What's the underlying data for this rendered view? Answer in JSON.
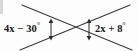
{
  "figure": {
    "type": "geometry-diagram",
    "background_color": "#fdfdfd",
    "stroke_color": "#3a3a3a",
    "text_color": "#151515",
    "labels": {
      "left": {
        "text": "4x − 30",
        "degree": "°",
        "full": "4x − 30°",
        "expression": "4x - 30",
        "position": "left vertical angle"
      },
      "right": {
        "text": "2x + 8",
        "degree": "°",
        "full": "2x + 8°",
        "expression": "2x + 8",
        "position": "right vertical angle"
      }
    },
    "markers": {
      "left_arrow_name": "left-angle-arrow",
      "right_arrow_name": "right-angle-arrow",
      "arrow_style": "double-headed vertical arrow"
    },
    "lines": [
      {
        "name": "line-upper-left-to-lower-right",
        "x1": 22,
        "y1": 5,
        "x2": 132,
        "y2": 50
      },
      {
        "name": "line-upper-right-to-lower-left",
        "x1": 130,
        "y1": 5,
        "x2": 20,
        "y2": 50
      }
    ],
    "intersection": {
      "x": 70,
      "y": 28
    }
  }
}
